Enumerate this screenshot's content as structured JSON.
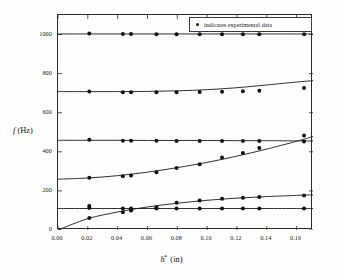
{
  "legend": {
    "marker": "filled-circle",
    "text": "indicates experimental data",
    "position": "top-right-inside"
  },
  "axes": {
    "ylabel_italic": "f",
    "ylabel_units": " (Hz)",
    "xlabel_italic": "h",
    "xlabel_superscript": "*",
    "xlabel_units": " (in)"
  },
  "chart_data": {
    "type": "line",
    "title": "",
    "subtitle": "",
    "xlabel": "h* (in)",
    "ylabel": "f (Hz)",
    "xlim": [
      0.0,
      0.171
    ],
    "ylim": [
      0,
      1100
    ],
    "xticks": [
      0.0,
      0.02,
      0.04,
      0.06,
      0.08,
      0.1,
      0.12,
      0.14,
      0.16
    ],
    "xtick_labels": [
      "0.00",
      "0.02",
      "0.04",
      "0.06",
      "0.08",
      "0.10",
      "0.12",
      "0.14",
      "0.16"
    ],
    "yticks": [
      0,
      200,
      400,
      600,
      800,
      1000
    ],
    "ytick_labels": [
      "0",
      "200",
      "400",
      "600",
      "800",
      "1000"
    ],
    "grid": false,
    "legend_position": "upper right",
    "annotations": [
      "indicates experimental data"
    ],
    "series": [
      {
        "name": "mode-6-theory",
        "kind": "theory-curve",
        "color": "#1a1a1a",
        "x": [
          0.0,
          0.02,
          0.04,
          0.06,
          0.08,
          0.1,
          0.12,
          0.14,
          0.16,
          0.171
        ],
        "values": [
          1003,
          1003,
          1003,
          1003,
          1003,
          1003,
          1003,
          1003,
          1003,
          1003
        ]
      },
      {
        "name": "mode-5-theory",
        "kind": "theory-curve",
        "color": "#1a1a1a",
        "x": [
          0.0,
          0.02,
          0.04,
          0.06,
          0.08,
          0.1,
          0.12,
          0.14,
          0.16,
          0.171
        ],
        "values": [
          708,
          708,
          708,
          709,
          712,
          718,
          728,
          742,
          757,
          764
        ]
      },
      {
        "name": "mode-4-theory",
        "kind": "theory-curve",
        "color": "#1a1a1a",
        "x": [
          0.0,
          0.02,
          0.04,
          0.06,
          0.08,
          0.1,
          0.12,
          0.14,
          0.16,
          0.171
        ],
        "values": [
          459,
          459,
          459,
          458,
          458,
          458,
          457,
          457,
          456,
          456
        ]
      },
      {
        "name": "mode-3-theory",
        "kind": "theory-curve",
        "color": "#1a1a1a",
        "x": [
          0.0,
          0.02,
          0.04,
          0.06,
          0.08,
          0.1,
          0.12,
          0.14,
          0.16,
          0.171
        ],
        "values": [
          260,
          266,
          278,
          296,
          319,
          346,
          378,
          414,
          454,
          478
        ]
      },
      {
        "name": "mode-2-theory",
        "kind": "theory-curve",
        "color": "#1a1a1a",
        "x": [
          0.0,
          0.02,
          0.04,
          0.06,
          0.08,
          0.1,
          0.12,
          0.14,
          0.16,
          0.171
        ],
        "values": [
          110,
          110,
          110,
          110,
          110,
          110,
          110,
          110,
          110,
          110
        ]
      },
      {
        "name": "mode-1-theory",
        "kind": "theory-curve",
        "color": "#1a1a1a",
        "x": [
          0.0,
          0.02,
          0.04,
          0.06,
          0.08,
          0.1,
          0.12,
          0.14,
          0.16,
          0.171
        ],
        "values": [
          0,
          58,
          92,
          118,
          137,
          152,
          163,
          171,
          177,
          180
        ]
      }
    ],
    "experimental_points": [
      {
        "x": 0.021,
        "y": 1005
      },
      {
        "x": 0.0435,
        "y": 1003
      },
      {
        "x": 0.049,
        "y": 1003
      },
      {
        "x": 0.066,
        "y": 1002
      },
      {
        "x": 0.0795,
        "y": 1002
      },
      {
        "x": 0.095,
        "y": 1001
      },
      {
        "x": 0.11,
        "y": 1001
      },
      {
        "x": 0.124,
        "y": 1001
      },
      {
        "x": 0.135,
        "y": 1001
      },
      {
        "x": 0.165,
        "y": 1001
      },
      {
        "x": 0.021,
        "y": 708
      },
      {
        "x": 0.0435,
        "y": 705
      },
      {
        "x": 0.049,
        "y": 705
      },
      {
        "x": 0.066,
        "y": 705
      },
      {
        "x": 0.0795,
        "y": 705
      },
      {
        "x": 0.095,
        "y": 706
      },
      {
        "x": 0.11,
        "y": 707
      },
      {
        "x": 0.124,
        "y": 710
      },
      {
        "x": 0.135,
        "y": 713
      },
      {
        "x": 0.165,
        "y": 726
      },
      {
        "x": 0.021,
        "y": 462
      },
      {
        "x": 0.0435,
        "y": 457
      },
      {
        "x": 0.049,
        "y": 457
      },
      {
        "x": 0.066,
        "y": 456
      },
      {
        "x": 0.0795,
        "y": 455
      },
      {
        "x": 0.095,
        "y": 455
      },
      {
        "x": 0.11,
        "y": 455
      },
      {
        "x": 0.124,
        "y": 455
      },
      {
        "x": 0.135,
        "y": 455
      },
      {
        "x": 0.165,
        "y": 453
      },
      {
        "x": 0.021,
        "y": 267
      },
      {
        "x": 0.0435,
        "y": 275
      },
      {
        "x": 0.049,
        "y": 279
      },
      {
        "x": 0.066,
        "y": 296
      },
      {
        "x": 0.0795,
        "y": 317
      },
      {
        "x": 0.095,
        "y": 337
      },
      {
        "x": 0.11,
        "y": 371
      },
      {
        "x": 0.124,
        "y": 394
      },
      {
        "x": 0.135,
        "y": 420
      },
      {
        "x": 0.165,
        "y": 484
      },
      {
        "x": 0.021,
        "y": 112
      },
      {
        "x": 0.0435,
        "y": 110
      },
      {
        "x": 0.049,
        "y": 110
      },
      {
        "x": 0.066,
        "y": 110
      },
      {
        "x": 0.0795,
        "y": 110
      },
      {
        "x": 0.095,
        "y": 110
      },
      {
        "x": 0.11,
        "y": 110
      },
      {
        "x": 0.124,
        "y": 110
      },
      {
        "x": 0.135,
        "y": 110
      },
      {
        "x": 0.165,
        "y": 110
      },
      {
        "x": 0.021,
        "y": 62
      },
      {
        "x": 0.021,
        "y": 123
      },
      {
        "x": 0.0435,
        "y": 91
      },
      {
        "x": 0.049,
        "y": 100
      },
      {
        "x": 0.049,
        "y": 104
      },
      {
        "x": 0.066,
        "y": 117
      },
      {
        "x": 0.0795,
        "y": 139
      },
      {
        "x": 0.095,
        "y": 151
      },
      {
        "x": 0.11,
        "y": 160
      },
      {
        "x": 0.124,
        "y": 165
      },
      {
        "x": 0.135,
        "y": 169
      },
      {
        "x": 0.165,
        "y": 176
      }
    ]
  }
}
